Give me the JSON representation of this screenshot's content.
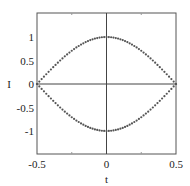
{
  "chart_data": {
    "type": "scatter",
    "title": "",
    "xlabel": "t",
    "ylabel": "I",
    "xlim": [
      -0.5,
      0.5
    ],
    "ylim": [
      -1.5,
      1.5
    ],
    "xticks": [
      "-0.5",
      "0",
      "0.5"
    ],
    "yticks": [
      "-1",
      "-0.5",
      "0",
      "0.5",
      "1"
    ],
    "grid": false,
    "zero_lines": true,
    "series": [
      {
        "name": "upper",
        "function": "cos(pi t)",
        "x_range": [
          -0.5,
          0.5
        ],
        "marker": "dot",
        "points": 60
      },
      {
        "name": "lower",
        "function": "-cos(pi t)",
        "x_range": [
          -0.5,
          0.5
        ],
        "marker": "dot",
        "points": 60
      }
    ],
    "sample_points": {
      "x": [
        -0.5,
        -0.25,
        0,
        0.25,
        0.5
      ],
      "upper": [
        0,
        0.71,
        1,
        0.71,
        0
      ],
      "lower": [
        0,
        -0.71,
        -1,
        -0.71,
        0
      ]
    }
  },
  "colors": {
    "marker": "#555555",
    "axis": "#333333"
  }
}
